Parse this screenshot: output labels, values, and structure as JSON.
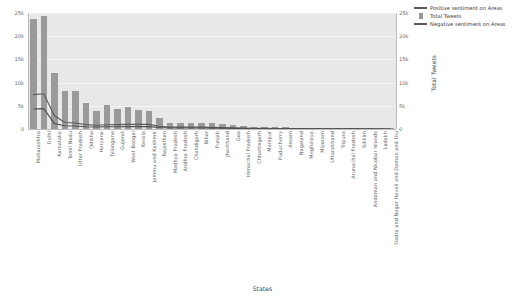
{
  "chart_data": {
    "type": "bar",
    "title": "",
    "xlabel": "States",
    "ylabel": "",
    "ylabel_right": "Total Tweets",
    "ylim": [
      0,
      25000
    ],
    "ylim_right": [
      0,
      25000
    ],
    "grid": true,
    "legend_position": "top-right",
    "ytick_labels_left": [
      "25k",
      "20k",
      "15k",
      "10k",
      "5k",
      "0"
    ],
    "ytick_values_left": [
      25000,
      20000,
      15000,
      10000,
      5000,
      0
    ],
    "ytick_labels_right": [
      "25k",
      "20k",
      "15k",
      "10k",
      "5k",
      "0"
    ],
    "ytick_values_right": [
      25000,
      20000,
      15000,
      10000,
      5000,
      0
    ],
    "categories": [
      "Maharashtra",
      "Delhi",
      "Karnataka",
      "Tamil Nadu",
      "Uttar Pradesh",
      "Odisha",
      "Haryana",
      "Telangana",
      "Gujarat",
      "West Bengal",
      "Kerala",
      "Jammu and Kashmir",
      "Rajasthan",
      "Madhya Pradesh",
      "Andhra Pradesh",
      "Chandigarh",
      "Bihar",
      "Punjab",
      "Jharkhand",
      "Goa",
      "Himachal Pradesh",
      "Chhattisgarh",
      "Manipur",
      "Puducherry",
      "Assam",
      "Nagaland",
      "Meghalaya",
      "Mizoram",
      "Uttarakhand",
      "Tripura",
      "Arunachal Pradesh",
      "Sikkim",
      "Andaman and Nicobar Islands",
      "Ladakh",
      "Dadra and Nagar Haveli and Daman and Diu"
    ],
    "series": [
      {
        "name": "Total Tweets",
        "type": "bar",
        "color": "#9a9a9a",
        "values": [
          23700,
          24300,
          12000,
          8200,
          8200,
          5500,
          3900,
          5200,
          4400,
          4700,
          4000,
          3800,
          2300,
          1400,
          1400,
          1400,
          1400,
          1200,
          1100,
          900,
          700,
          500,
          420,
          380,
          330,
          300,
          260,
          230,
          200,
          180,
          150,
          130,
          110,
          90,
          70
        ]
      },
      {
        "name": "Positive sentiment on Areas",
        "type": "line",
        "color": "#5a5a5a",
        "values": [
          7400,
          7600,
          2900,
          1400,
          1300,
          950,
          800,
          900,
          950,
          1000,
          1000,
          1000,
          600,
          400,
          400,
          400,
          400,
          350,
          300,
          250,
          200,
          160,
          130,
          110,
          95,
          85,
          75,
          65,
          55,
          48,
          40,
          34,
          28,
          22,
          16
        ]
      },
      {
        "name": "Negative sentiment on Areas",
        "type": "line",
        "color": "#4f4f4f",
        "values": [
          4300,
          4400,
          1200,
          700,
          650,
          500,
          420,
          480,
          500,
          520,
          520,
          520,
          330,
          220,
          220,
          220,
          220,
          190,
          170,
          140,
          110,
          90,
          70,
          60,
          52,
          46,
          40,
          35,
          30,
          26,
          22,
          18,
          15,
          12,
          9
        ]
      }
    ],
    "legend": [
      {
        "label": "Positive sentiment on Areas",
        "marker": "line"
      },
      {
        "label": "Total Tweets",
        "marker": "bar"
      },
      {
        "label": "Negative sentiment on Areas",
        "marker": "line"
      }
    ]
  }
}
